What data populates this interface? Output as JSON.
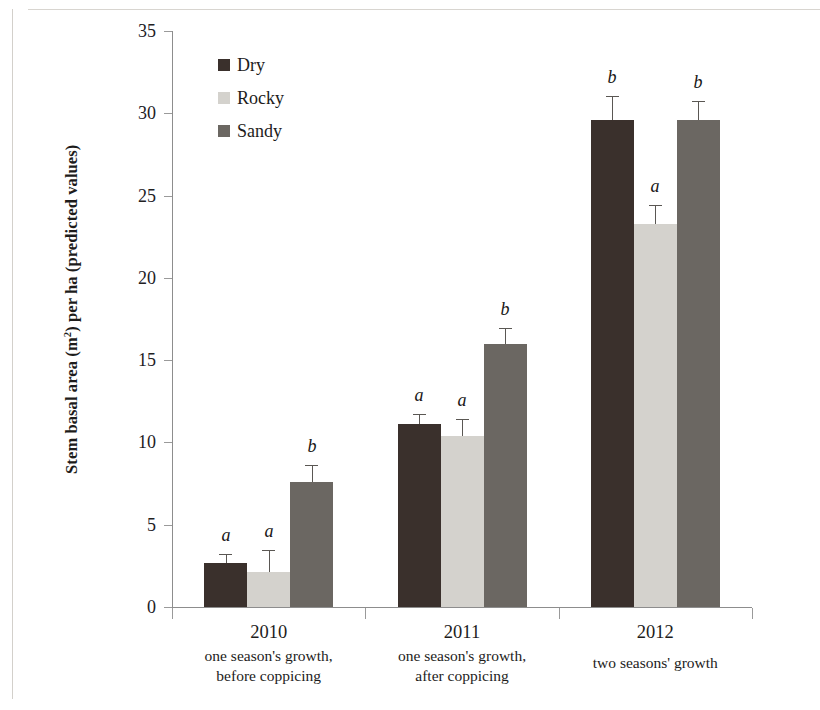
{
  "chart_data": {
    "type": "bar",
    "title": "",
    "subtitle": "",
    "xlabel": "",
    "ylabel": "Stem basal area (m²) per ha (predicted values)",
    "ylabel_html": "Stem basal area (m<sup>2</sup>) per ha (predicted values)",
    "ylim": [
      0,
      35
    ],
    "ytick_values": [
      0,
      5,
      10,
      15,
      20,
      25,
      30,
      35
    ],
    "ytick_labels": [
      "0",
      "5",
      "10",
      "15",
      "20",
      "25",
      "30",
      "35"
    ],
    "grid": false,
    "legend_position": "top-left inside plot",
    "categories": [
      "2010",
      "2011",
      "2012"
    ],
    "category_sublabels": [
      [
        "one season's growth,",
        "before coppicing"
      ],
      [
        "one season's growth,",
        "after coppicing"
      ],
      [
        "two seasons' growth"
      ]
    ],
    "series": [
      {
        "name": "Dry",
        "color": "#3a302c",
        "values": [
          2.65,
          11.1,
          29.6
        ],
        "errors": [
          0.55,
          0.65,
          1.45
        ],
        "sig_letters": [
          "a",
          "a",
          "b"
        ]
      },
      {
        "name": "Rocky",
        "color": "#d4d2cd",
        "values": [
          2.15,
          10.4,
          23.3
        ],
        "errors": [
          1.3,
          1.05,
          1.1
        ],
        "sig_letters": [
          "a",
          "a",
          "a"
        ]
      },
      {
        "name": "Sandy",
        "color": "#6b6762",
        "values": [
          7.6,
          16.0,
          29.6
        ],
        "errors": [
          1.05,
          0.95,
          1.15
        ],
        "sig_letters": [
          "b",
          "b",
          "b"
        ]
      }
    ]
  },
  "legend": {
    "items": [
      {
        "label": "Dry",
        "color": "#3a302c"
      },
      {
        "label": "Rocky",
        "color": "#d4d2cd"
      },
      {
        "label": "Sandy",
        "color": "#6b6762"
      }
    ]
  },
  "axis": {
    "y_title": "Stem basal area (m",
    "y_title_sup": "2",
    "y_title_rest": ") per ha (predicted values)",
    "y_ticks": [
      "35",
      "30",
      "25",
      "20",
      "15",
      "10",
      "5",
      "0"
    ]
  },
  "x_axis": {
    "groups": [
      {
        "year": "2010",
        "line1": "one season's growth,",
        "line2": "before coppicing"
      },
      {
        "year": "2011",
        "line1": "one season's growth,",
        "line2": "after coppicing"
      },
      {
        "year": "2012",
        "line1": "two seasons' growth",
        "line2": ""
      }
    ]
  }
}
